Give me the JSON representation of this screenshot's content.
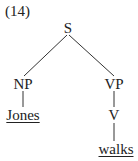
{
  "example_number": "(14)",
  "tree": {
    "root": {
      "label": "S",
      "children": [
        {
          "label": "NP",
          "children": [
            {
              "label": "Jones",
              "leaf": true
            }
          ]
        },
        {
          "label": "VP",
          "children": [
            {
              "label": "V",
              "children": [
                {
                  "label": "walks",
                  "leaf": true
                }
              ]
            }
          ]
        }
      ]
    }
  },
  "labels": {
    "s": "S",
    "np": "NP",
    "vp": "VP",
    "v": "V",
    "jones": "Jones",
    "walks": "walks"
  }
}
